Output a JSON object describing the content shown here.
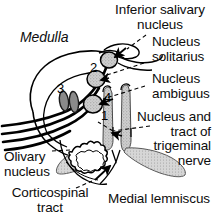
{
  "figure": {
    "region_label": "Medulla",
    "background_color": "#ffffff",
    "ink_color": "#000000",
    "shading_color": "#c9c9c9"
  },
  "labels": {
    "inferior_salivary_nucleus": "Inferior salivary\nnucleus",
    "nucleus_solitarius": "Nucleus\nsolitarius",
    "nucleus_ambiguus": "Nucleus\nambiguus",
    "trigeminal": "Nucleus and\ntract of\ntrigeminal\nnerve",
    "olivary_nucleus": "Olivary\nnucleus",
    "corticospinal_tract": "Corticospinal\ntract",
    "medial_lemniscus": "Medial lemniscus",
    "medulla": "Medulla"
  },
  "callout_numbers": [
    {
      "id": "1",
      "value": "1"
    },
    {
      "id": "2",
      "value": "2"
    },
    {
      "id": "3",
      "value": "3"
    },
    {
      "id": "4",
      "value": "4"
    }
  ]
}
